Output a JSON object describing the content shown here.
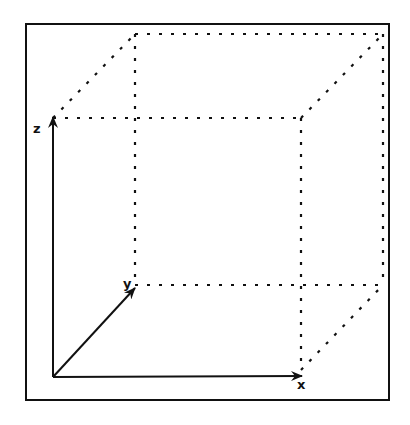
{
  "figure": {
    "type": "3D coordinate axes with dotted cube",
    "axes": {
      "x": {
        "label": "x"
      },
      "y": {
        "label": "y"
      },
      "z": {
        "label": "z"
      }
    },
    "colors": {
      "ink": "#111111",
      "background": "#ffffff"
    }
  }
}
